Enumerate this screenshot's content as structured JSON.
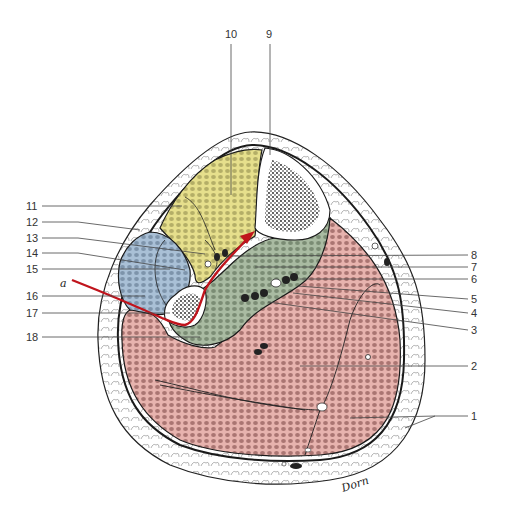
{
  "figure": {
    "signature": "Dorn",
    "arrow_label": "a",
    "colors": {
      "anterior_compartment": "#e6df8c",
      "lateral_compartment": "#a9c0d6",
      "deep_posterior_compartment": "#a9bba2",
      "superficial_posterior_compartment": "#e7b3ae",
      "subcutaneous_fat": "#ffffff",
      "bone_marrow": "#222222",
      "arrow": "#c0141c",
      "muscle_pattern_yellow": "#8f8a4e",
      "muscle_pattern_blue": "#6a8199",
      "muscle_pattern_green": "#62735c",
      "muscle_pattern_pink": "#8e5a58"
    }
  },
  "labels": {
    "left": [
      {
        "id": "11",
        "text": "11"
      },
      {
        "id": "12",
        "text": "12"
      },
      {
        "id": "13",
        "text": "13"
      },
      {
        "id": "14",
        "text": "14"
      },
      {
        "id": "15",
        "text": "15"
      },
      {
        "id": "16",
        "text": "16"
      },
      {
        "id": "17",
        "text": "17"
      },
      {
        "id": "18",
        "text": "18"
      }
    ],
    "top": [
      {
        "id": "10",
        "text": "10"
      },
      {
        "id": "9",
        "text": "9"
      }
    ],
    "right": [
      {
        "id": "8",
        "text": "8"
      },
      {
        "id": "7",
        "text": "7"
      },
      {
        "id": "6",
        "text": "6"
      },
      {
        "id": "5",
        "text": "5"
      },
      {
        "id": "4",
        "text": "4"
      },
      {
        "id": "3",
        "text": "3"
      },
      {
        "id": "2",
        "text": "2"
      },
      {
        "id": "1",
        "text": "1"
      }
    ]
  }
}
